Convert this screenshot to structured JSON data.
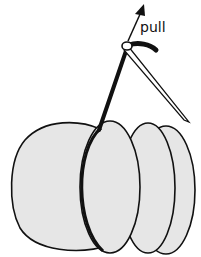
{
  "diagram": {
    "labels": {
      "pull": "pull"
    },
    "colors": {
      "fill": "#e6e6e6",
      "stroke": "#111111",
      "background": "#ffffff"
    },
    "parts": [
      "fabric-circle-back",
      "fabric-circle-middle",
      "fabric-circle-front",
      "fabric-large-left",
      "thread",
      "needle",
      "pull-arrow"
    ]
  }
}
